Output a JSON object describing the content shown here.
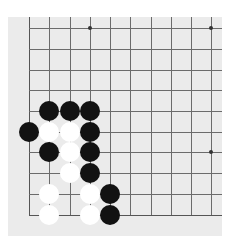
{
  "board": {
    "background_color": "#ebebeb",
    "line_color": "#6b6b6b",
    "visible_columns": 10,
    "visible_rows": 10,
    "column_x": [
      29,
      49,
      70,
      90,
      110,
      130,
      151,
      171,
      191,
      211
    ],
    "row_y": [
      28,
      49,
      70,
      90,
      111,
      132,
      152,
      173,
      194,
      215
    ],
    "left_edge_is_border": true,
    "bottom_edge_is_border": true,
    "star_points": [
      {
        "col": 3,
        "row": 0
      },
      {
        "col": 9,
        "row": 0
      },
      {
        "col": 9,
        "row": 6
      }
    ]
  },
  "stones": [
    {
      "color": "black",
      "col": 1,
      "row": 4
    },
    {
      "color": "black",
      "col": 2,
      "row": 4
    },
    {
      "color": "black",
      "col": 3,
      "row": 4
    },
    {
      "color": "black",
      "col": 0,
      "row": 5
    },
    {
      "color": "white",
      "col": 1,
      "row": 5
    },
    {
      "color": "white",
      "col": 2,
      "row": 5
    },
    {
      "color": "black",
      "col": 3,
      "row": 5
    },
    {
      "color": "black",
      "col": 1,
      "row": 6
    },
    {
      "color": "white",
      "col": 2,
      "row": 6
    },
    {
      "color": "black",
      "col": 3,
      "row": 6
    },
    {
      "color": "white",
      "col": 2,
      "row": 7
    },
    {
      "color": "black",
      "col": 3,
      "row": 7
    },
    {
      "color": "white",
      "col": 1,
      "row": 8
    },
    {
      "color": "white",
      "col": 3,
      "row": 8
    },
    {
      "color": "black",
      "col": 4,
      "row": 8
    },
    {
      "color": "white",
      "col": 1,
      "row": 9
    },
    {
      "color": "white",
      "col": 3,
      "row": 9
    },
    {
      "color": "black",
      "col": 4,
      "row": 9
    }
  ]
}
